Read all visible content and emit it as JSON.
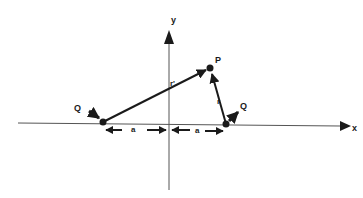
{
  "diagram": {
    "axes": {
      "x_label": "x",
      "y_label": "y"
    },
    "points": {
      "P": {
        "label": "P",
        "x": 210,
        "y": 68
      },
      "Q_left": {
        "label": "Q",
        "x": 103,
        "y": 122
      },
      "Q_right": {
        "label": "Q",
        "x": 226,
        "y": 124
      }
    },
    "vectors": {
      "r_prime": {
        "label": "r'",
        "from": "Q_left",
        "to": "P"
      },
      "r": {
        "label": "r",
        "from": "Q_right",
        "to": "P"
      }
    },
    "distances": {
      "left": {
        "label": "a"
      },
      "right": {
        "label": "a"
      }
    },
    "colors": {
      "ink": "#1a1a1a",
      "axis": "#555555",
      "background": "#ffffff"
    }
  }
}
